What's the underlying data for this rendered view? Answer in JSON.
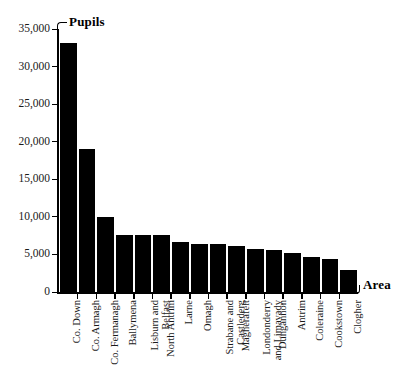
{
  "chart_data": {
    "type": "bar",
    "title": "",
    "xlabel": "Area",
    "ylabel": "Pupils",
    "ylim": [
      0,
      35000
    ],
    "grid": false,
    "legend": "none",
    "y_ticks": [
      "0",
      "5,000",
      "10,000",
      "15,000",
      "20,000",
      "25,000",
      "30,000",
      "35,000"
    ],
    "y_tick_values": [
      0,
      5000,
      10000,
      15000,
      20000,
      25000,
      30000,
      35000
    ],
    "categories": [
      "Co. Down",
      "Co. Armagh",
      "Co. Fermanagh",
      "Ballymena",
      "Lisburn and Belfast",
      "North Antrim",
      "Larne",
      "Omagh",
      "Strabane and Castlederg",
      "Magherafelt",
      "Londonderry and Limavady",
      "Dungannon",
      "Antrim",
      "Coleraine",
      "Cookstown",
      "Clogher"
    ],
    "category_lines": [
      [
        "Co. Down"
      ],
      [
        "Co. Armagh"
      ],
      [
        "Co. Fermanagh"
      ],
      [
        "Ballymena"
      ],
      [
        "Lisburn and",
        "Belfast"
      ],
      [
        "North Antrim"
      ],
      [
        "Larne"
      ],
      [
        "Omagh"
      ],
      [
        "Strabane and",
        "Castlederg"
      ],
      [
        "Magherafelt"
      ],
      [
        "Londonderry",
        "and Limavady"
      ],
      [
        "Dungannon"
      ],
      [
        "Antrim"
      ],
      [
        "Coleraine"
      ],
      [
        "Cookstown"
      ],
      [
        "Clogher"
      ]
    ],
    "values": [
      33100,
      19000,
      10000,
      7600,
      7600,
      7550,
      6600,
      6400,
      6350,
      6100,
      5700,
      5600,
      5200,
      4700,
      4400,
      2900
    ],
    "bar_color": "#000000",
    "axis_color": "#000000"
  }
}
